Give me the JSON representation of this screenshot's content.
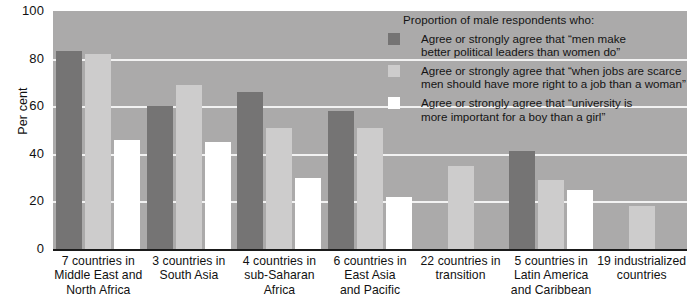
{
  "chart_data": {
    "type": "bar",
    "title": "",
    "xlabel": "",
    "ylabel": "Per cent",
    "ylim": [
      0,
      100
    ],
    "ytick_labels": [
      "100",
      "80",
      "60",
      "40",
      "20",
      "0"
    ],
    "ytick_values": [
      100,
      80,
      60,
      40,
      20,
      0
    ],
    "grid": true,
    "legend_position": "top-right",
    "legend_title": "Proportion of male respondents who:",
    "categories": [
      "7 countries in Middle East and North Africa",
      "3 countries in South Asia",
      "4 countries in sub-Saharan Africa",
      "6 countries in East Asia and Pacific",
      "22 countries in transition",
      "5 countries in Latin America and Caribbean",
      "19 industrialized countries"
    ],
    "category_lines": [
      [
        "7 countries in",
        "Middle East and",
        "North Africa"
      ],
      [
        "3 countries in",
        "South Asia"
      ],
      [
        "4 countries in",
        "sub-Saharan",
        "Africa"
      ],
      [
        "6 countries in",
        "East Asia",
        "and Pacific"
      ],
      [
        "22 countries in",
        "transition"
      ],
      [
        "5 countries in",
        "Latin America",
        "and Caribbean"
      ],
      [
        "19 industrialized",
        "countries"
      ]
    ],
    "series": [
      {
        "name": "Agree or strongly agree that “men make better political leaders than women do”",
        "name_lines": [
          "Agree or strongly agree that “men make",
          "better political leaders than women do”"
        ],
        "color": "#757474",
        "values": [
          83,
          60,
          66,
          58,
          null,
          41,
          null
        ]
      },
      {
        "name": "Agree or strongly agree that “when jobs are scarce men should have more right to a job than a woman”",
        "name_lines": [
          "Agree or strongly agree that “when jobs are scarce",
          "men should have more right to a job than a woman”"
        ],
        "color": "#cdcccc",
        "values": [
          82,
          69,
          51,
          51,
          35,
          29,
          18
        ]
      },
      {
        "name": "Agree or strongly agree that “university is more important for a boy than a girl”",
        "name_lines": [
          "Agree or strongly agree that “university is",
          "more important for a boy than a girl”"
        ],
        "color": "#ffffff",
        "values": [
          46,
          45,
          30,
          22,
          null,
          25,
          null
        ]
      }
    ],
    "plot_background": "#abaaaa",
    "gridline_color": "#f2f2f2",
    "axis_color": "#1b1b1b"
  }
}
